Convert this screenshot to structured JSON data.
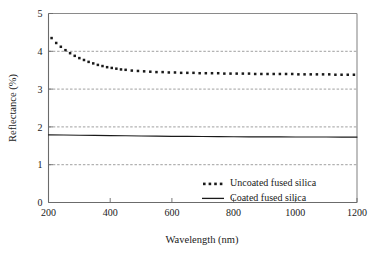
{
  "chart_data": {
    "type": "line",
    "title": "",
    "xlabel": "Wavelength (nm)",
    "ylabel": "Reflectance (%)",
    "xlim": [
      200,
      1200
    ],
    "ylim": [
      0,
      5
    ],
    "xticks": [
      200,
      400,
      600,
      800,
      1000,
      1200
    ],
    "yticks": [
      0,
      1,
      2,
      3,
      4,
      5
    ],
    "xtick_labels": [
      "200",
      "400",
      "600",
      "800",
      "1000",
      "1200"
    ],
    "ytick_labels": [
      "0",
      "1",
      "2",
      "3",
      "4",
      "5"
    ],
    "grid": "horizontal dashed gridlines at y = 1, 2, 3, 4",
    "legend_position": "inside plot, lower center-right",
    "colors": {
      "ink": "#1a1a1a",
      "axis": "#555555",
      "grid": "#777777",
      "background": "#ffffff"
    },
    "series": [
      {
        "name": "Uncoated fused silica",
        "style": "dotted",
        "marker": "square-dot",
        "x": [
          210,
          225,
          240,
          255,
          270,
          285,
          300,
          315,
          330,
          345,
          360,
          375,
          390,
          405,
          420,
          435,
          450,
          470,
          490,
          510,
          530,
          550,
          570,
          590,
          610,
          630,
          650,
          670,
          690,
          710,
          730,
          750,
          770,
          790,
          810,
          830,
          850,
          870,
          890,
          910,
          930,
          950,
          970,
          990,
          1010,
          1030,
          1050,
          1070,
          1090,
          1110,
          1130,
          1150,
          1170,
          1190
        ],
        "values": [
          4.35,
          4.22,
          4.12,
          4.03,
          3.95,
          3.88,
          3.82,
          3.77,
          3.72,
          3.68,
          3.64,
          3.61,
          3.58,
          3.56,
          3.54,
          3.52,
          3.51,
          3.49,
          3.48,
          3.47,
          3.46,
          3.45,
          3.45,
          3.44,
          3.44,
          3.43,
          3.43,
          3.43,
          3.42,
          3.42,
          3.42,
          3.42,
          3.41,
          3.41,
          3.41,
          3.41,
          3.41,
          3.4,
          3.4,
          3.4,
          3.4,
          3.4,
          3.4,
          3.4,
          3.39,
          3.39,
          3.39,
          3.39,
          3.39,
          3.39,
          3.38,
          3.38,
          3.38,
          3.38
        ]
      },
      {
        "name": "Coated fused silica",
        "style": "solid",
        "x": [
          200,
          250,
          300,
          350,
          400,
          450,
          500,
          550,
          600,
          650,
          700,
          750,
          800,
          850,
          900,
          950,
          1000,
          1050,
          1100,
          1150,
          1200
        ],
        "values": [
          1.79,
          1.785,
          1.78,
          1.775,
          1.77,
          1.765,
          1.76,
          1.755,
          1.75,
          1.748,
          1.745,
          1.742,
          1.74,
          1.738,
          1.736,
          1.735,
          1.734,
          1.733,
          1.732,
          1.731,
          1.73
        ]
      }
    ],
    "legend_entries": [
      {
        "label": "Uncoated fused silica",
        "style": "dotted"
      },
      {
        "label": "Coated fused silica",
        "style": "solid"
      }
    ]
  }
}
